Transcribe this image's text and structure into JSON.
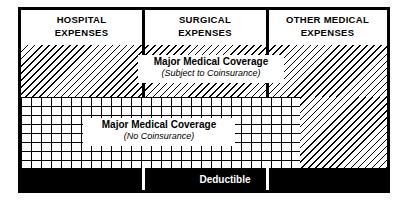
{
  "diagram": {
    "columns": [
      {
        "id": "hospital",
        "label": "HOSPITAL\nEXPENSES"
      },
      {
        "id": "surgical",
        "label": "SURGICAL\nEXPENSES"
      },
      {
        "id": "other_medical",
        "label": "OTHER MEDICAL\nEXPENSES"
      }
    ],
    "bands": {
      "coinsurance": {
        "title": "Major Medical Coverage",
        "subtitle": "(Subject to Coinsurance)",
        "pattern": "diagonal-hatch"
      },
      "no_coinsurance": {
        "title": "Major Medical Coverage",
        "subtitle": "(No Coinsurance)",
        "pattern": "cross-hatch-grid"
      },
      "deductible": {
        "label": "Deductible",
        "pattern": "solid-black"
      }
    },
    "colors": {
      "ink": "#000000",
      "paper": "#ffffff"
    }
  }
}
